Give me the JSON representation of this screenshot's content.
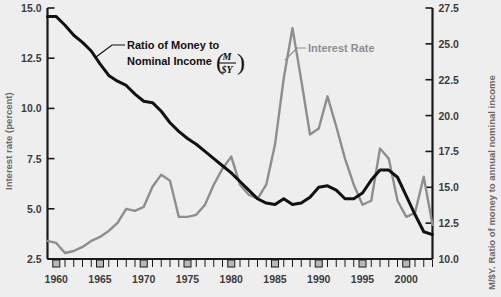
{
  "figure": {
    "background_color": "#eeeeee",
    "money_color": "#111111",
    "interest_color": "#8e8e8e"
  },
  "left_axis": {
    "title": "Interest rate (percent)",
    "ticks": [
      "15.0",
      "12.5",
      "10.0",
      "7.5",
      "5.0",
      "2.5"
    ],
    "min": 2.5,
    "max": 15.0
  },
  "right_axis": {
    "title": "M/$Y. Ratio of money to annual nominal income",
    "ticks": [
      "27.5",
      "25.0",
      "22.5",
      "20.0",
      "17.5",
      "15.0",
      "12.5",
      "10.0"
    ],
    "min": 10.0,
    "max": 27.5
  },
  "x_axis": {
    "labels": [
      "1960",
      "1965",
      "1970",
      "1975",
      "1980",
      "1985",
      "1990",
      "1995",
      "2000"
    ],
    "min": 1959,
    "max": 2003
  },
  "annotations": {
    "money_label_line1": "Ratio of Money to",
    "money_label_line2": "Nominal Income",
    "money_fraction_numerator": "M",
    "money_fraction_denominator": "$Y",
    "interest_label": "Interest Rate"
  },
  "chart_data": {
    "type": "line",
    "title": "",
    "xlabel": "",
    "ylabel": "Interest rate (percent)",
    "y2label": "M/$Y. Ratio of money to annual nominal income",
    "xlim": [
      1959,
      2003
    ],
    "ylim": [
      2.5,
      15.0
    ],
    "y2lim": [
      10.0,
      27.5
    ],
    "grid": false,
    "legend_position": "inline-annotation",
    "x": [
      1959,
      1960,
      1961,
      1962,
      1963,
      1964,
      1965,
      1966,
      1967,
      1968,
      1969,
      1970,
      1971,
      1972,
      1973,
      1974,
      1975,
      1976,
      1977,
      1978,
      1979,
      1980,
      1981,
      1982,
      1983,
      1984,
      1985,
      1986,
      1987,
      1988,
      1989,
      1990,
      1991,
      1992,
      1993,
      1994,
      1995,
      1996,
      1997,
      1998,
      1999,
      2000,
      2001,
      2002,
      2003
    ],
    "series": [
      {
        "name": "Ratio of Money to Nominal Income (M/$Y)",
        "axis": "right",
        "units": "percent ratio M/$Y",
        "color": "#111111",
        "values": [
          26.9,
          26.9,
          26.3,
          25.6,
          25.1,
          24.5,
          23.6,
          22.8,
          22.4,
          22.1,
          21.5,
          21.0,
          20.9,
          20.3,
          19.5,
          18.9,
          18.4,
          18.0,
          17.5,
          17.0,
          16.5,
          16.0,
          15.4,
          14.8,
          14.2,
          13.9,
          13.8,
          14.2,
          13.8,
          13.9,
          14.3,
          15.0,
          15.1,
          14.8,
          14.2,
          14.2,
          14.6,
          15.5,
          16.2,
          16.2,
          15.7,
          14.4,
          13.1,
          11.9,
          11.7
        ],
        "secondary_values_note": "plotted against right axis"
      },
      {
        "name": "Interest Rate",
        "axis": "left",
        "units": "percent",
        "color": "#8e8e8e",
        "values": [
          3.4,
          3.3,
          2.8,
          2.9,
          3.1,
          3.4,
          3.6,
          3.9,
          4.3,
          5.0,
          4.9,
          5.1,
          6.1,
          6.7,
          6.4,
          4.6,
          4.6,
          4.7,
          5.2,
          6.2,
          7.0,
          7.6,
          6.2,
          5.7,
          5.5,
          6.2,
          8.2,
          12.0,
          14.0,
          25.5,
          22.5,
          21.0,
          20.4,
          17.5,
          15.0,
          14.4,
          16.0,
          17.3,
          17.0,
          14.8,
          12.0,
          10.6,
          11.5,
          12.7,
          13.6
        ],
        "note": "series plotted on left axis; values are interest rate percent readings"
      }
    ],
    "interest_rate_percent": [
      3.4,
      3.3,
      2.8,
      2.9,
      3.1,
      3.4,
      3.6,
      3.9,
      4.3,
      5.0,
      4.9,
      5.1,
      6.1,
      6.7,
      6.4,
      4.6,
      4.6,
      4.7,
      5.2,
      6.2,
      7.0,
      7.6,
      6.2,
      5.7,
      5.5,
      6.2,
      8.2,
      11.5,
      14.0,
      11.4,
      8.7,
      9.0,
      10.6,
      9.1,
      7.5,
      6.2,
      5.2,
      5.4,
      8.0,
      7.5,
      5.4,
      4.6,
      4.8,
      6.6,
      4.2
    ],
    "money_ratio_msy": [
      26.9,
      26.9,
      26.3,
      25.6,
      25.1,
      24.5,
      23.6,
      22.8,
      22.4,
      22.1,
      21.5,
      21.0,
      20.9,
      20.3,
      19.5,
      18.9,
      18.4,
      18.0,
      17.5,
      17.0,
      16.5,
      16.0,
      15.4,
      14.8,
      14.2,
      13.9,
      13.8,
      14.2,
      13.8,
      13.9,
      14.3,
      15.0,
      15.1,
      14.8,
      14.2,
      14.2,
      14.6,
      15.5,
      16.2,
      16.2,
      15.7,
      14.4,
      13.1,
      11.9,
      11.7
    ]
  }
}
